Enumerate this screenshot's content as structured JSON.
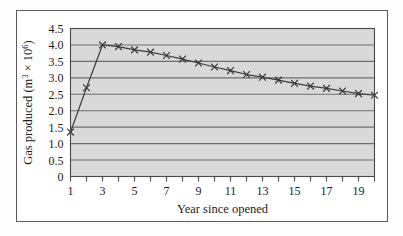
{
  "figure": {
    "background_color": "#fdfdfd",
    "frame_color": "#5a5a5a"
  },
  "chart_data": {
    "type": "line",
    "title": "",
    "xlabel": "Year since opened",
    "ylabel": "Gas produced (m³ × 10⁶)",
    "ylabel_parts": {
      "main": "Gas produced (m",
      "sup1": "3",
      "mid": " × 10",
      "sup2": "6",
      "tail": ")"
    },
    "plot_background": "#d9d9d9",
    "grid": true,
    "grid_axis": "y",
    "grid_color": "#6e6e6e",
    "legend": "none",
    "series_color": "#3a3a3a",
    "marker": "x",
    "xlim": [
      1,
      20
    ],
    "ylim": [
      0,
      4.5
    ],
    "x": [
      1,
      2,
      3,
      4,
      5,
      6,
      7,
      8,
      9,
      10,
      11,
      12,
      13,
      14,
      15,
      16,
      17,
      18,
      19,
      20
    ],
    "values": [
      1.35,
      2.7,
      4.0,
      3.95,
      3.85,
      3.78,
      3.68,
      3.57,
      3.45,
      3.33,
      3.22,
      3.1,
      3.02,
      2.93,
      2.83,
      2.75,
      2.68,
      2.6,
      2.52,
      2.47
    ],
    "xticks": [
      1,
      2,
      3,
      4,
      5,
      6,
      7,
      8,
      9,
      10,
      11,
      12,
      13,
      14,
      15,
      16,
      17,
      18,
      19,
      20
    ],
    "xtick_labels": [
      "1",
      "",
      "3",
      "",
      "5",
      "",
      "7",
      "",
      "9",
      "",
      "11",
      "",
      "13",
      "",
      "15",
      "",
      "17",
      "",
      "19",
      ""
    ],
    "yticks": [
      0,
      0.5,
      1.0,
      1.5,
      2.0,
      2.5,
      3.0,
      3.5,
      4.0,
      4.5
    ],
    "ytick_labels": [
      "0",
      "0.5",
      "1.0",
      "1.5",
      "2.0",
      "2.5",
      "3.0",
      "3.5",
      "4.0",
      "4.5"
    ]
  }
}
